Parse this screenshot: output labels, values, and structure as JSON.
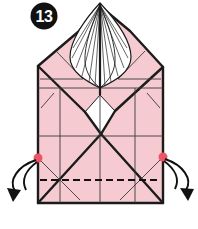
{
  "step": {
    "number": "13",
    "description": "Origami instruction step 13: fold bottom corners down and back along dashed valley fold"
  },
  "diagram": {
    "type": "origami-instruction-figure",
    "paper_color": "#f5cbd1",
    "outline_color": "#1b1b1b",
    "crease_color": "#3a3a3a",
    "dot_color": "#ee5468",
    "fold_line_style": "dashed",
    "badge": {
      "background": "#111111",
      "text_color": "#ffffff"
    },
    "markers": {
      "left_dot": "fold-reference-point-left",
      "right_dot": "fold-reference-point-right",
      "left_arrow": "curl-fold-arrow-left",
      "right_arrow": "curl-fold-arrow-right",
      "fan": "pleated-fan-crest",
      "diamond": "center-open-diamond"
    }
  }
}
